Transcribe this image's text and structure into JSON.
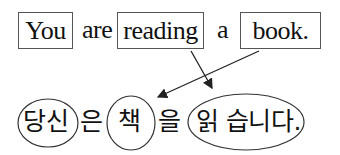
{
  "english": {
    "words": [
      {
        "text": "You",
        "boxed": true
      },
      {
        "text": "are",
        "boxed": false
      },
      {
        "text": "reading",
        "boxed": true
      },
      {
        "text": "a",
        "boxed": false
      },
      {
        "text": "book.",
        "boxed": true
      }
    ]
  },
  "korean": {
    "segments": [
      {
        "text": "당신",
        "circled": true
      },
      {
        "text": "은",
        "circled": false
      },
      {
        "text": "책",
        "circled": true
      },
      {
        "text": "을",
        "circled": false
      },
      {
        "text": "읽 습니다.",
        "circled": true
      }
    ]
  },
  "arrows": [
    {
      "from": "reading",
      "to": "읽 습니다."
    },
    {
      "from": "book.",
      "to": "책"
    }
  ],
  "colors": {
    "stroke": "#333333",
    "box_border": "#555555",
    "text": "#111111"
  }
}
